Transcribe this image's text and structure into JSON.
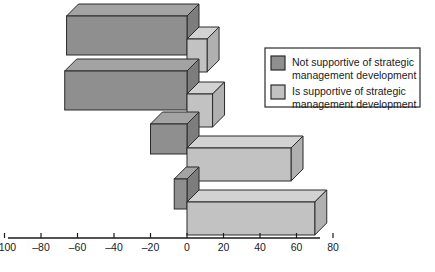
{
  "chart_data": {
    "type": "bar",
    "orientation": "horizontal",
    "style": "3d",
    "title": "",
    "xlabel": "",
    "ylabel": "",
    "xlim": [
      -110,
      95
    ],
    "xticks": [
      -100,
      -80,
      -60,
      -40,
      -20,
      0,
      20,
      40,
      60,
      80
    ],
    "xticklabels": [
      "–100",
      "–80",
      "–60",
      "–40",
      "–20",
      "0",
      "20",
      "40",
      "60",
      "80"
    ],
    "grid": false,
    "categories": [
      "Group 1",
      "Group 2",
      "Group 3",
      "Group 4"
    ],
    "legend_position": "right",
    "series": [
      {
        "name": "Not supportive of strategic management development",
        "color": "#8f8f8f",
        "top_color": "#a3a3a3",
        "side_color": "#7d7d7d",
        "values": [
          -66,
          -67,
          -20,
          -7
        ]
      },
      {
        "name": "Is supportive of strategic management development",
        "color": "#c2c2c2",
        "top_color": "#d2d2d2",
        "side_color": "#b0b0b0",
        "values": [
          11,
          14,
          57,
          70
        ]
      }
    ]
  },
  "legend": {
    "items": [
      {
        "swatch_color": "#8f8f8f",
        "line1": "Not supportive of strategic",
        "line2": "management development"
      },
      {
        "swatch_color": "#c2c2c2",
        "line1": "Is supportive of strategic",
        "line2": "management development"
      }
    ]
  },
  "axis": {
    "ticks": [
      {
        "value": -100,
        "label": "–100"
      },
      {
        "value": -80,
        "label": "–80"
      },
      {
        "value": -60,
        "label": "–60"
      },
      {
        "value": -40,
        "label": "–40"
      },
      {
        "value": -20,
        "label": "–20"
      },
      {
        "value": 0,
        "label": "0"
      },
      {
        "value": 20,
        "label": "20"
      },
      {
        "value": 40,
        "label": "40"
      },
      {
        "value": 60,
        "label": "60"
      },
      {
        "value": 80,
        "label": "80"
      }
    ]
  },
  "colors": {
    "dark_front": "#8f8f8f",
    "dark_top": "#a3a3a3",
    "dark_side": "#7d7d7d",
    "light_front": "#c2c2c2",
    "light_top": "#d2d2d2",
    "light_side": "#b0b0b0",
    "stroke": "#2b2b2b",
    "axis": "#1a1a1a",
    "background": "#ffffff"
  }
}
